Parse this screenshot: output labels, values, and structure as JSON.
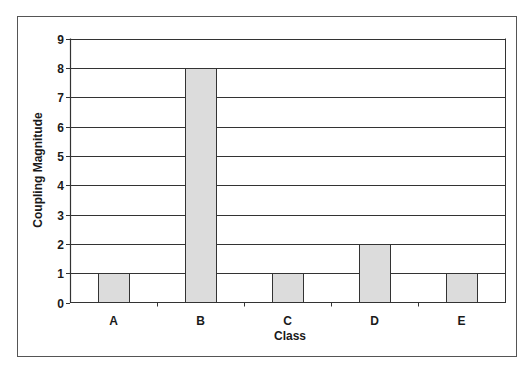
{
  "chart_data": {
    "type": "bar",
    "title": "",
    "xlabel": "Class",
    "ylabel": "Coupling Magnitude",
    "categories": [
      "A",
      "B",
      "C",
      "D",
      "E"
    ],
    "values": [
      1,
      8,
      1,
      2,
      1
    ],
    "ylim": [
      0,
      9
    ],
    "yticks": [
      0,
      1,
      2,
      3,
      4,
      5,
      6,
      7,
      8,
      9
    ],
    "grid": true,
    "legend": null
  },
  "colors": {
    "bar_fill": "#dcdcdc",
    "bar_stroke": "#333333",
    "grid": "#333333",
    "frame": "#555555",
    "background": "#ffffff"
  }
}
